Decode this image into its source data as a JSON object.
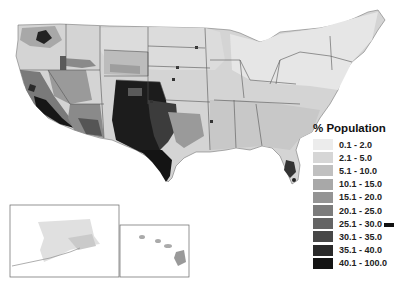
{
  "legend": {
    "title": "% Population",
    "items": [
      {
        "label": "0.1 - 2.0",
        "color": "#ececec"
      },
      {
        "label": "2.1 - 5.0",
        "color": "#d6d6d6"
      },
      {
        "label": "5.1 - 10.0",
        "color": "#c0c0c0"
      },
      {
        "label": "10.1 - 15.0",
        "color": "#a8a8a8"
      },
      {
        "label": "15.1 - 20.0",
        "color": "#949494"
      },
      {
        "label": "20.1 - 25.0",
        "color": "#7c7c7c"
      },
      {
        "label": "25.1 - 30.0",
        "color": "#646464"
      },
      {
        "label": "30.1 - 35.0",
        "color": "#474747"
      },
      {
        "label": "35.1 - 40.0",
        "color": "#2a2a2a"
      },
      {
        "label": "40.1 - 100.0",
        "color": "#141414"
      }
    ]
  },
  "map": {
    "subject": "Contiguous United States county-level choropleth",
    "insets": [
      "Alaska",
      "Hawaii"
    ]
  }
}
